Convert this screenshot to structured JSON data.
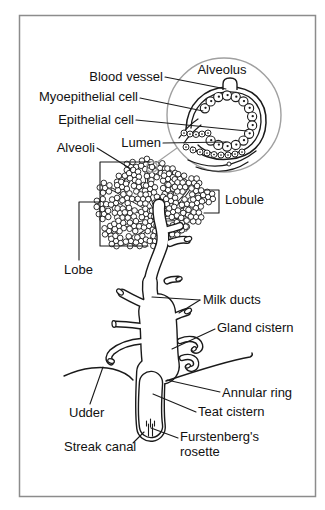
{
  "figure": {
    "labels": {
      "alveolus": "Alveolus",
      "blood_vessel": "Blood vessel",
      "myoepithelial_cell": "Myoepithelial cell",
      "epithelial_cell": "Epithelial cell",
      "lumen": "Lumen",
      "alveoli": "Alveoli",
      "lobule": "Lobule",
      "lobe": "Lobe",
      "milk_ducts": "Milk ducts",
      "gland_cistern": "Gland cistern",
      "annular_ring": "Annular ring",
      "udder": "Udder",
      "teat_cistern": "Teat cistern",
      "furstenbergs_line1": "Furstenberg's",
      "furstenbergs_line2": "rosette",
      "streak_canal": "Streak canal"
    },
    "colors": {
      "ink": "#1a1a1a",
      "inset_circle": "#a0a0a0",
      "border": "#8c8c8c",
      "background": "#ffffff"
    }
  }
}
